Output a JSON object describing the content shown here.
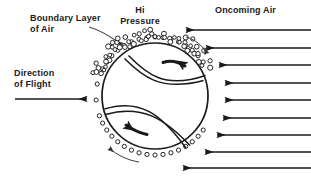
{
  "diagram": {
    "background_color": "#ffffff",
    "ink_color": "#1a1a1a",
    "width": 311,
    "height": 180
  },
  "labels": {
    "boundary_layer": {
      "line1": "Boundary Layer",
      "line2": "of Air",
      "x": 30,
      "y": 13
    },
    "hi_pressure": {
      "line1": "Hi",
      "line2": "Pressure",
      "x": 112,
      "y": 5
    },
    "oncoming_air": {
      "line1": "Oncoming Air",
      "x": 215,
      "y": 5
    },
    "direction_of_flight": {
      "line1": "Direction",
      "line2": "of Flight",
      "x": 14,
      "y": 68
    }
  },
  "ball": {
    "center_x": 155,
    "center_y": 96,
    "radius": 53,
    "seam_style": "baseball-double-curve",
    "outline_color": "#1a1a1a",
    "outline_width": 1.6
  },
  "boundary_layer_ring": {
    "description": "ring of small open circles around the ball representing the boundary layer of air",
    "bead_radius": 2.1,
    "ring_radius": 59,
    "bead_count": 46,
    "gap_start_deg": 250,
    "gap_end_deg": 292
  },
  "turbulent_cluster": {
    "description": "dense cluster of circles at the top of the ball where the boundary layer separates, marked Hi Pressure",
    "center_x": 155,
    "center_y": 38,
    "bead_count": 54
  },
  "rotation_arrows": [
    {
      "name": "upper-spin-arrow",
      "direction": "clockwise-right",
      "x": 178,
      "y": 65
    },
    {
      "name": "lower-spin-arrow",
      "direction": "clockwise-left",
      "x": 132,
      "y": 130
    }
  ],
  "flow_arrows": {
    "oncoming_air_count": 9,
    "lines": [
      {
        "y": 30,
        "x_start": 311,
        "x_end": 185,
        "head": true
      },
      {
        "y": 48,
        "x_start": 311,
        "x_end": 205,
        "head": true
      },
      {
        "y": 65,
        "x_start": 311,
        "x_end": 218,
        "head": true
      },
      {
        "y": 83,
        "x_start": 311,
        "x_end": 224,
        "head": true
      },
      {
        "y": 100,
        "x_start": 311,
        "x_end": 224,
        "head": true
      },
      {
        "y": 118,
        "x_start": 311,
        "x_end": 222,
        "head": true
      },
      {
        "y": 135,
        "x_start": 311,
        "x_end": 216,
        "head": true
      },
      {
        "y": 152,
        "x_start": 311,
        "x_end": 204,
        "head": true
      },
      {
        "y": 168,
        "x_start": 311,
        "x_end": 182,
        "head": true
      }
    ]
  },
  "flight_arrow": {
    "name": "direction-of-flight-arrow",
    "y": 99,
    "x_start": 15,
    "x_end": 88,
    "direction": "right"
  },
  "pointer_leader": {
    "name": "boundary-layer-pointer",
    "from_x": 90,
    "from_y": 28,
    "to_x": 124,
    "to_y": 47
  },
  "surface_flow_arcs": [
    {
      "name": "top-right-surface-arc",
      "direction": "clockwise"
    },
    {
      "name": "bottom-left-surface-arc",
      "direction": "clockwise"
    }
  ]
}
